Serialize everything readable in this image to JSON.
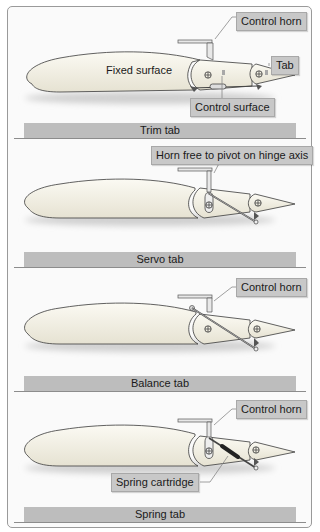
{
  "figure": {
    "panels": [
      {
        "caption": "Trim tab",
        "labels": {
          "fixed_surface": "Fixed surface",
          "control_horn": "Control horn",
          "tab": "Tab",
          "control_surface": "Control surface"
        }
      },
      {
        "caption": "Servo tab",
        "labels": {
          "horn_pivot": "Horn free to pivot on hinge axis"
        }
      },
      {
        "caption": "Balance tab",
        "labels": {
          "control_horn": "Control horn"
        }
      },
      {
        "caption": "Spring tab",
        "labels": {
          "control_horn": "Control horn",
          "spring_cartridge": "Spring cartridge"
        }
      }
    ],
    "colors": {
      "frame_border": "#9a9a9a",
      "caption_bar": "#bdbdbd",
      "callout_box": "#c8c8c8",
      "airfoil_fill": "#f4f1e6",
      "outline": "#3a3a3a"
    }
  }
}
